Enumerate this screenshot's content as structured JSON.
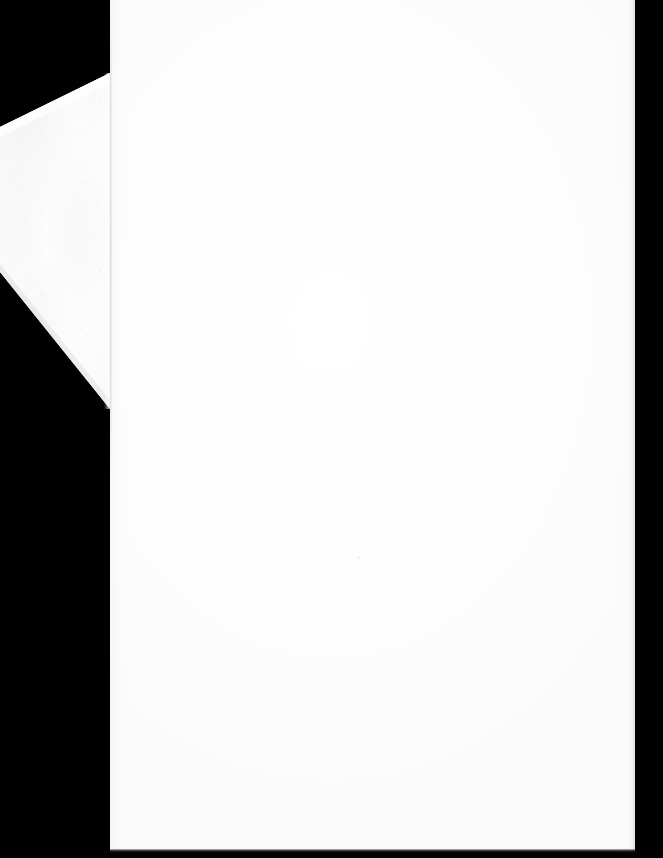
{
  "document": {
    "kind": "scanned-blank-page",
    "title": "Scanned blank page with folded corner",
    "page_content": "",
    "page_text": "",
    "visible_text": "",
    "notes_label": "",
    "page_color": "#ffffff",
    "background_color": "#000000",
    "flap_color": "#fbfbfb",
    "edge_shadow_color": "#000000"
  },
  "page": {
    "label": "",
    "left_px": 110,
    "top_px": 0,
    "width_px": 525,
    "height_px": 853
  },
  "folded_corner": {
    "label": "",
    "vertices": "110,73 0,127 0,272 110,409"
  },
  "canvas": {
    "width_px": 663,
    "height_px": 858
  }
}
